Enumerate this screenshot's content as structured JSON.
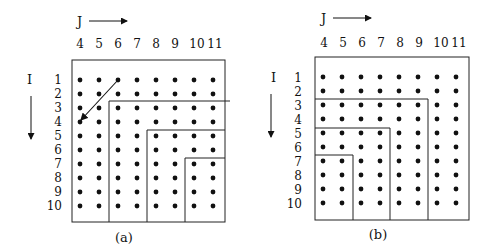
{
  "figure": {
    "panels": [
      {
        "id": "a",
        "caption": "(a)",
        "j_label": "J",
        "i_label": "I",
        "columns": [
          "4",
          "5",
          "6",
          "7",
          "8",
          "9",
          "10",
          "11"
        ],
        "rows": [
          "1",
          "2",
          "3",
          "4",
          "5",
          "6",
          "7",
          "8",
          "9",
          "10"
        ],
        "partition": "staircase blocks by column: cols 4-5 rows 1-10; cols 6-7 rows 3-10; cols 8-9 rows 5-10; cols 10-11 rows 7-10",
        "arrow": {
          "from": "I=1,J=6",
          "to": "I=4,J=4"
        }
      },
      {
        "id": "b",
        "caption": "(b)",
        "j_label": "J",
        "i_label": "I",
        "columns": [
          "4",
          "5",
          "6",
          "7",
          "8",
          "9",
          "10",
          "11"
        ],
        "rows": [
          "1",
          "2",
          "3",
          "4",
          "5",
          "6",
          "7",
          "8",
          "9",
          "10"
        ],
        "partition": "nested L blocks: cols 10-11 all rows plus rows 1-2; cols 8-9 rows 3-10 plus rows 3-4 left; cols 6-7 rows 5-10 plus rows 5-6; cols 4-5 rows 7-10"
      }
    ]
  }
}
